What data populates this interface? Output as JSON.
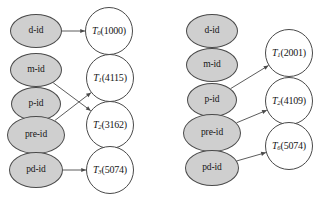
{
  "figure": {
    "type": "diagram",
    "background_color": "#ffffff",
    "entity_fill": "#cfcfcf",
    "txn_fill": "#ffffff",
    "stroke_color": "#4a4a4a"
  },
  "panels": [
    {
      "id": "left-panel",
      "name": "left-graph",
      "entities": [
        {
          "id": "l-d",
          "label": "d-id",
          "cx": 36,
          "cy": 31,
          "rx": 26,
          "ry": 17
        },
        {
          "id": "l-m",
          "label": "m-id",
          "cx": 36,
          "cy": 70,
          "rx": 26,
          "ry": 17
        },
        {
          "id": "l-p",
          "label": "p-id",
          "cx": 36,
          "cy": 104,
          "rx": 25,
          "ry": 17
        },
        {
          "id": "l-pre",
          "label": "pre-id",
          "cx": 36,
          "cy": 135,
          "rx": 29,
          "ry": 19
        },
        {
          "id": "l-pd",
          "label": "pd-id",
          "cx": 36,
          "cy": 170,
          "rx": 27,
          "ry": 18
        }
      ],
      "transactions": [
        {
          "id": "l-t0",
          "name": "T",
          "sub": "0",
          "value": "(1000)",
          "label": "T0(1000)",
          "cx": 109,
          "cy": 31,
          "r": 24
        },
        {
          "id": "l-t1",
          "name": "T",
          "sub": "1",
          "value": "(4115)",
          "label": "T1(4115)",
          "cx": 110,
          "cy": 78,
          "r": 24
        },
        {
          "id": "l-t2",
          "name": "T",
          "sub": "2",
          "value": "(3162)",
          "label": "T2(3162)",
          "cx": 110,
          "cy": 125,
          "r": 24
        },
        {
          "id": "l-t3",
          "name": "T",
          "sub": "3",
          "value": "(5074)",
          "label": "T3(5074)",
          "cx": 110,
          "cy": 170,
          "r": 24
        }
      ],
      "edges": [
        {
          "from": "l-d",
          "to": "l-t0",
          "arrow": true
        },
        {
          "from": "l-m",
          "to": "l-t2",
          "arrow": true
        },
        {
          "from": "l-pre",
          "to": "l-t1",
          "arrow": true
        },
        {
          "from": "l-pd",
          "to": "l-t3",
          "arrow": true
        }
      ]
    },
    {
      "id": "right-panel",
      "name": "right-graph",
      "entities": [
        {
          "id": "r-d",
          "label": "d-id",
          "cx": 212,
          "cy": 31,
          "rx": 26,
          "ry": 17
        },
        {
          "id": "r-m",
          "label": "m-id",
          "cx": 212,
          "cy": 65,
          "rx": 26,
          "ry": 17
        },
        {
          "id": "r-p",
          "label": "p-id",
          "cx": 212,
          "cy": 100,
          "rx": 25,
          "ry": 17
        },
        {
          "id": "r-pre",
          "label": "pre-id",
          "cx": 212,
          "cy": 133,
          "rx": 29,
          "ry": 19
        },
        {
          "id": "r-pd",
          "label": "pd-id",
          "cx": 212,
          "cy": 168,
          "rx": 27,
          "ry": 18
        }
      ],
      "transactions": [
        {
          "id": "r-t1",
          "name": "T",
          "sub": "1",
          "value": "(2001)",
          "label": "T1(2001)",
          "cx": 289,
          "cy": 53,
          "r": 24
        },
        {
          "id": "r-t2",
          "name": "T",
          "sub": "2",
          "value": "(4109)",
          "label": "T2(4109)",
          "cx": 289,
          "cy": 101,
          "r": 24
        },
        {
          "id": "r-t6",
          "name": "T",
          "sub": "6",
          "value": "(5074)",
          "label": "T6(5074)",
          "cx": 289,
          "cy": 146,
          "r": 24
        }
      ],
      "edges": [
        {
          "from": "r-p",
          "to": "r-t1",
          "arrow": true
        },
        {
          "from": "r-pre",
          "to": "r-t2",
          "arrow": true
        },
        {
          "from": "r-pd",
          "to": "r-t6",
          "arrow": true
        }
      ]
    }
  ]
}
